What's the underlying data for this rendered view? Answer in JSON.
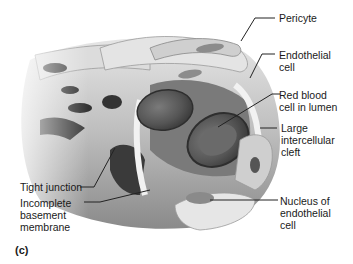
{
  "figure": {
    "panel_label": "(c)",
    "labels": {
      "pericyte": "Pericyte",
      "endothelial_cell": "Endothelial\ncell",
      "red_blood_cell": "Red blood\ncell in lumen",
      "intercellular_cleft": "Large\nintercellular\ncleft",
      "nucleus": "Nucleus of\nendothelial\ncell",
      "tight_junction": "Tight junction",
      "basement_membrane": "Incomplete\nbasement\nmembrane"
    },
    "colors": {
      "tissue_light": "#d9d9d9",
      "tissue_mid": "#a6a6a6",
      "tissue_dark": "#4a4a4a",
      "rbc": "#5c5c5c",
      "line": "#222222"
    }
  }
}
